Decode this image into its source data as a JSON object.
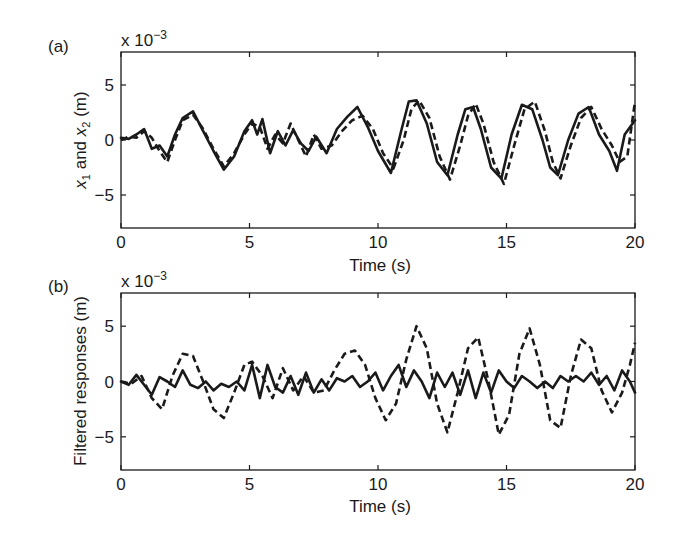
{
  "chart_data": [
    {
      "panel": "(a)",
      "type": "line",
      "title": "",
      "xlabel": "Time (s)",
      "ylabel": "x1 and x2 (m)",
      "ylabel_parts": {
        "x": "x",
        "sub1": "1",
        "mid": " and ",
        "sub2": "2",
        "unit": " (m)"
      },
      "multiplier": "x 10",
      "multiplier_exp": "−3",
      "xlim": [
        0,
        20
      ],
      "ylim": [
        -8,
        8
      ],
      "xticks": [
        0,
        5,
        10,
        15,
        20
      ],
      "yticks": [
        -5,
        0,
        5
      ],
      "ytick_labels": [
        "−5",
        "0",
        "5"
      ],
      "grid": false,
      "series": [
        {
          "name": "x1",
          "style": "solid",
          "x": [
            0,
            0.3,
            0.6,
            0.9,
            1.2,
            1.5,
            1.8,
            2.1,
            2.4,
            2.8,
            3.2,
            3.6,
            4.0,
            4.4,
            4.8,
            5.1,
            5.3,
            5.5,
            5.8,
            6.1,
            6.4,
            6.7,
            7.0,
            7.3,
            7.6,
            8.0,
            8.4,
            8.8,
            9.2,
            9.6,
            10.0,
            10.5,
            10.9,
            11.2,
            11.5,
            11.9,
            12.3,
            12.7,
            13.1,
            13.4,
            13.7,
            14.0,
            14.4,
            14.8,
            15.2,
            15.6,
            16.0,
            16.4,
            16.7,
            17.0,
            17.4,
            17.8,
            18.2,
            18.6,
            19.0,
            19.3,
            19.6,
            20.0
          ],
          "y": [
            0.2,
            0.1,
            0.5,
            1.0,
            -0.8,
            -0.5,
            -1.5,
            0.5,
            2.0,
            2.6,
            0.8,
            -1.0,
            -2.7,
            -1.5,
            0.8,
            1.8,
            0.5,
            1.9,
            -1.2,
            0.8,
            -0.5,
            0.9,
            -0.3,
            -1.0,
            0.3,
            -1.2,
            1.0,
            2.1,
            3.0,
            1.2,
            -1.0,
            -3.0,
            0.8,
            3.5,
            3.6,
            1.5,
            -2.0,
            -3.2,
            0.5,
            2.8,
            3.0,
            1.0,
            -2.5,
            -3.5,
            0.5,
            3.2,
            2.8,
            0.0,
            -2.5,
            -3.2,
            0.0,
            2.4,
            3.0,
            0.5,
            -1.0,
            -2.8,
            0.5,
            1.8
          ]
        },
        {
          "name": "x2",
          "style": "dashed",
          "x": [
            0,
            0.3,
            0.6,
            0.9,
            1.2,
            1.5,
            1.8,
            2.1,
            2.4,
            2.8,
            3.2,
            3.6,
            4.0,
            4.4,
            4.8,
            5.1,
            5.4,
            5.7,
            6.0,
            6.3,
            6.6,
            6.9,
            7.2,
            7.5,
            7.8,
            8.2,
            8.6,
            9.0,
            9.4,
            9.8,
            10.2,
            10.6,
            11.0,
            11.3,
            11.6,
            12.0,
            12.4,
            12.8,
            13.2,
            13.5,
            13.8,
            14.1,
            14.5,
            14.9,
            15.3,
            15.7,
            16.1,
            16.5,
            16.8,
            17.1,
            17.5,
            17.9,
            18.3,
            18.7,
            19.1,
            19.4,
            19.7,
            20.0
          ],
          "y": [
            0.0,
            0.3,
            0.2,
            0.8,
            0.2,
            -1.0,
            -2.0,
            0.0,
            1.8,
            2.3,
            1.0,
            -0.8,
            -2.4,
            -1.2,
            0.5,
            1.5,
            1.2,
            -0.8,
            0.5,
            -0.3,
            1.5,
            0.0,
            -1.5,
            0.5,
            -0.8,
            -0.5,
            0.8,
            1.8,
            2.2,
            1.0,
            -1.2,
            -2.6,
            0.0,
            2.8,
            3.6,
            2.0,
            -1.5,
            -3.6,
            -0.5,
            2.2,
            3.3,
            1.5,
            -2.0,
            -4.0,
            -0.5,
            2.8,
            3.5,
            0.8,
            -2.0,
            -3.5,
            -0.5,
            2.0,
            3.0,
            1.0,
            -0.5,
            -2.0,
            -1.5,
            3.5
          ]
        }
      ]
    },
    {
      "panel": "(b)",
      "type": "line",
      "title": "",
      "xlabel": "Time (s)",
      "ylabel": "Filtered responses (m)",
      "multiplier": "x 10",
      "multiplier_exp": "−3",
      "xlim": [
        0,
        20
      ],
      "ylim": [
        -8,
        8
      ],
      "xticks": [
        0,
        5,
        10,
        15,
        20
      ],
      "yticks": [
        -5,
        0,
        5
      ],
      "ytick_labels": [
        "−5",
        "0",
        "5"
      ],
      "grid": false,
      "series": [
        {
          "name": "filtered solid",
          "style": "solid",
          "x": [
            0,
            0.3,
            0.6,
            0.9,
            1.2,
            1.5,
            1.8,
            2.1,
            2.4,
            2.7,
            3.0,
            3.3,
            3.6,
            3.9,
            4.2,
            4.5,
            4.8,
            5.1,
            5.4,
            5.7,
            6.0,
            6.3,
            6.6,
            6.9,
            7.2,
            7.5,
            7.8,
            8.1,
            8.4,
            8.7,
            9.0,
            9.3,
            9.6,
            9.9,
            10.2,
            10.5,
            10.8,
            11.1,
            11.4,
            11.7,
            12.0,
            12.3,
            12.6,
            12.9,
            13.2,
            13.5,
            13.8,
            14.1,
            14.4,
            14.7,
            15.0,
            15.3,
            15.6,
            15.9,
            16.2,
            16.5,
            16.8,
            17.1,
            17.4,
            17.7,
            18.0,
            18.3,
            18.6,
            18.9,
            19.2,
            19.5,
            19.8,
            20.0
          ],
          "y": [
            0.0,
            -0.3,
            0.6,
            -0.3,
            -1.2,
            0.4,
            0.0,
            -0.5,
            1.0,
            -0.3,
            -0.6,
            0.0,
            -0.8,
            -0.2,
            -0.5,
            0.0,
            -0.8,
            1.5,
            -1.5,
            1.5,
            -0.5,
            -1.0,
            0.5,
            -1.2,
            0.8,
            -1.0,
            0.2,
            -0.8,
            0.3,
            0.0,
            0.5,
            -0.5,
            0.0,
            0.8,
            -0.8,
            0.5,
            1.5,
            -0.5,
            1.0,
            0.0,
            -1.5,
            0.8,
            -0.5,
            0.8,
            -1.2,
            1.0,
            -1.5,
            0.8,
            -1.0,
            1.0,
            0.0,
            -0.6,
            0.5,
            0.0,
            -0.6,
            0.0,
            -0.6,
            0.5,
            0.0,
            0.5,
            0.0,
            0.8,
            -0.3,
            0.5,
            -0.8,
            1.0,
            0.0,
            -1.0
          ]
        },
        {
          "name": "filtered dashed",
          "style": "dashed",
          "x": [
            0,
            0.4,
            0.8,
            1.2,
            1.6,
            2.0,
            2.4,
            2.8,
            3.2,
            3.6,
            4.0,
            4.4,
            4.8,
            5.1,
            5.5,
            5.9,
            6.3,
            6.7,
            7.1,
            7.5,
            7.9,
            8.3,
            8.7,
            9.1,
            9.5,
            9.9,
            10.3,
            10.7,
            11.1,
            11.5,
            11.9,
            12.3,
            12.7,
            13.1,
            13.5,
            13.9,
            14.3,
            14.7,
            15.1,
            15.5,
            15.9,
            16.3,
            16.7,
            17.1,
            17.5,
            17.9,
            18.3,
            18.7,
            19.1,
            19.5,
            19.8,
            20.0
          ],
          "y": [
            0.0,
            -0.2,
            0.5,
            -1.5,
            -2.5,
            0.5,
            2.5,
            2.3,
            0.0,
            -2.5,
            -3.3,
            -1.0,
            1.5,
            1.8,
            0.5,
            -1.5,
            1.2,
            -0.8,
            0.5,
            -1.0,
            -0.8,
            1.0,
            2.5,
            2.8,
            1.5,
            -1.5,
            -3.5,
            -2.0,
            2.0,
            5.0,
            3.0,
            -2.0,
            -4.6,
            -1.0,
            3.0,
            4.0,
            0.0,
            -4.8,
            -3.0,
            2.5,
            4.8,
            1.5,
            -3.5,
            -4.2,
            0.5,
            3.8,
            3.0,
            -0.8,
            -2.8,
            -1.0,
            1.5,
            3.5
          ]
        }
      ]
    }
  ],
  "labels": {
    "panel_a": "(a)",
    "panel_b": "(b)"
  }
}
